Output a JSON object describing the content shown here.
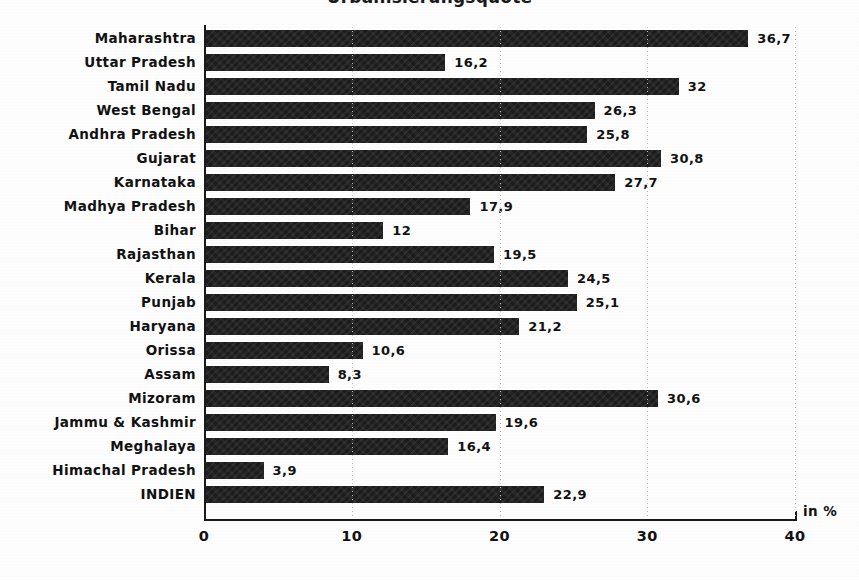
{
  "chart_data": {
    "type": "bar",
    "orientation": "horizontal",
    "title": "Urbanisierungsquote",
    "xlabel": "in %",
    "ylabel": "",
    "xlim": [
      0,
      40
    ],
    "xticks": [
      "0",
      "10",
      "20",
      "30",
      "40"
    ],
    "xtick_values": [
      0,
      10,
      20,
      30,
      40
    ],
    "grid": "vertical-dotted",
    "legend": "none",
    "decimal_separator": ",",
    "categories": [
      "Maharashtra",
      "Uttar Pradesh",
      "Tamil Nadu",
      "West Bengal",
      "Andhra Pradesh",
      "Gujarat",
      "Karnataka",
      "Madhya Pradesh",
      "Bihar",
      "Rajasthan",
      "Kerala",
      "Punjab",
      "Haryana",
      "Orissa",
      "Assam",
      "Mizoram",
      "Jammu & Kashmir",
      "Meghalaya",
      "Himachal Pradesh",
      "INDIEN"
    ],
    "values": [
      36.7,
      16.2,
      32,
      26.3,
      25.8,
      30.8,
      27.7,
      17.9,
      12,
      19.5,
      24.5,
      25.1,
      21.2,
      10.6,
      8.3,
      30.6,
      19.6,
      16.4,
      3.9,
      22.9
    ],
    "value_labels": [
      "36,7",
      "16,2",
      "32",
      "26,3",
      "25,8",
      "30,8",
      "27,7",
      "17,9",
      "12",
      "19,5",
      "24,5",
      "25,1",
      "21,2",
      "10,6",
      "8,3",
      "30,6",
      "19,6",
      "16,4",
      "3,9",
      "22,9"
    ],
    "bar_color": "#1c1c1c",
    "background_color": "#fdfdfd"
  }
}
